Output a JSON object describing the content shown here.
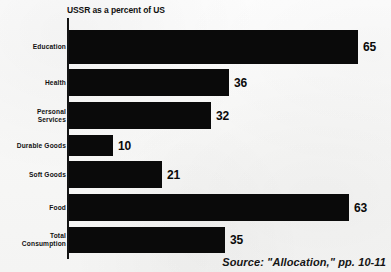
{
  "chart_data": {
    "type": "bar",
    "orientation": "horizontal",
    "title": "USSR as a percent of US",
    "xlabel": "",
    "ylabel": "",
    "xlim": [
      0,
      65
    ],
    "grid": false,
    "legend": "none",
    "categories": [
      "Education",
      "Health",
      "Personal\nServices",
      "Durable Goods",
      "Soft Goods",
      "Food",
      "Total\nConsumption"
    ],
    "values": [
      65,
      36,
      32,
      10,
      21,
      63,
      35
    ],
    "value_labels": [
      "65",
      "36",
      "32",
      "10",
      "21",
      "63",
      "35"
    ],
    "series": [
      {
        "name": "USSR as a percent of US",
        "values": [
          65,
          36,
          32,
          10,
          21,
          63,
          35
        ]
      }
    ],
    "annotations": [
      "Source: \"Allocation,\" pp. 10-11"
    ],
    "bar_color": "#0a0a0a",
    "background_color": "#f8f8f7",
    "axis_color": "#141414"
  },
  "source": {
    "text": "Source: \"Allocation,\" pp. 10-11"
  }
}
